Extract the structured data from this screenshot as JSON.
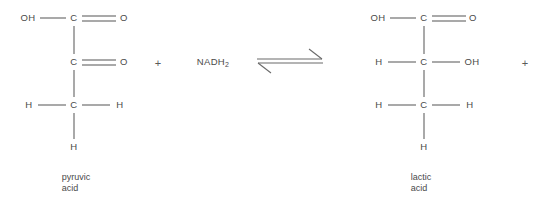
{
  "diagram": {
    "line_color": "#555555",
    "text_color": "#4a4a4a",
    "background": "#ffffff"
  },
  "reactant": {
    "caption_line1": "pyruvic",
    "caption_line2": "acid",
    "atoms": {
      "hydroxyl_top": "OH",
      "carbon_1": "C",
      "oxygen_1": "O",
      "carbon_2": "C",
      "oxygen_2": "O",
      "hydrogen_left": "H",
      "carbon_3": "C",
      "hydrogen_right": "H",
      "hydrogen_bottom": "H"
    }
  },
  "product": {
    "caption_line1": "lactic",
    "caption_line2": "acid",
    "atoms": {
      "hydroxyl_top": "OH",
      "carbon_1": "C",
      "oxygen_1": "O",
      "hydrogen_left_mid": "H",
      "carbon_2": "C",
      "hydroxyl_mid": "OH",
      "hydrogen_left_low": "H",
      "carbon_3": "C",
      "hydrogen_right_low": "H",
      "hydrogen_bottom": "H"
    }
  },
  "operators": {
    "plus_left": "+",
    "plus_right": "+"
  },
  "cofactor": {
    "name": "NADH",
    "subscript": "2"
  },
  "arrow": {
    "type": "equilibrium",
    "direction": "reversible"
  }
}
